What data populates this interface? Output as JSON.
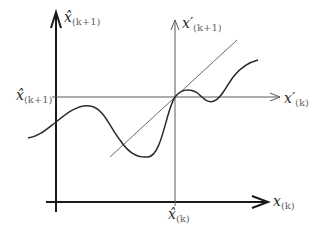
{
  "diagram": {
    "colors": {
      "axis": "#1a1a1a",
      "thin_axis": "#5a5a5a",
      "curve": "#2a2a2a",
      "tangent": "#6a6a6a",
      "background": "#ffffff"
    },
    "labels": {
      "main_y_axis": {
        "base": "x̂",
        "sub": "(k+1)"
      },
      "main_x_axis": {
        "base": "x",
        "sub": "(k)"
      },
      "prime_y_axis": {
        "base": "x′",
        "sub": "(k+1)"
      },
      "prime_x_axis": {
        "base": "x′",
        "sub": "(k)"
      },
      "tick_y_operating": {
        "base": "x̂",
        "sub": "(k+1)"
      },
      "tick_x_operating": {
        "base": "x̂",
        "sub": "(k)"
      }
    },
    "geometry": {
      "main_origin": [
        56,
        202
      ],
      "operating_point": [
        175,
        97
      ],
      "tangent_line": {
        "from": [
          110,
          157
        ],
        "to": [
          237,
          40
        ]
      },
      "curve_points": [
        [
          28,
          138
        ],
        [
          56,
          122
        ],
        [
          88,
          106
        ],
        [
          118,
          135
        ],
        [
          140,
          156
        ],
        [
          160,
          150
        ],
        [
          175,
          97
        ],
        [
          190,
          92
        ],
        [
          210,
          104
        ],
        [
          230,
          80
        ],
        [
          258,
          60
        ]
      ]
    }
  }
}
